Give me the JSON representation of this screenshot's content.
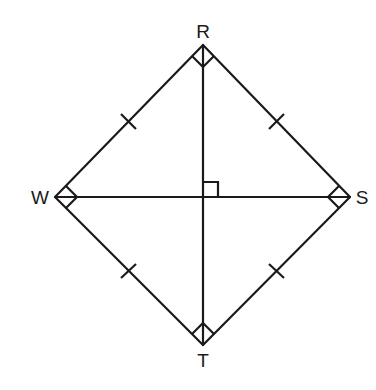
{
  "figure": {
    "type": "rhombus-square",
    "stroke_color": "#1a1a1a",
    "background": "#ffffff",
    "vertices": {
      "R": {
        "label": "R",
        "x": 203,
        "y": 45
      },
      "S": {
        "label": "S",
        "x": 350,
        "y": 197
      },
      "T": {
        "label": "T",
        "x": 203,
        "y": 345
      },
      "W": {
        "label": "W",
        "x": 55,
        "y": 197
      }
    },
    "sides": [
      "WR",
      "RS",
      "ST",
      "TW"
    ],
    "diagonals": [
      "RT",
      "WS"
    ],
    "congruence_ticks": [
      "WR",
      "RS",
      "WT",
      "TS"
    ],
    "right_angle_markers": [
      "R",
      "S",
      "T",
      "W",
      "center"
    ]
  },
  "labels": {
    "R": "R",
    "S": "S",
    "T": "T",
    "W": "W"
  }
}
